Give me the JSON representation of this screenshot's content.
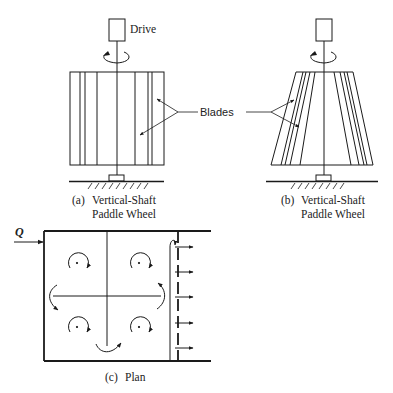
{
  "figure": {
    "labels": {
      "drive": "Drive",
      "blades": "Blades",
      "inflow": "Q"
    },
    "panels": [
      {
        "id": "a",
        "tag": "(a)",
        "title_line1": "Vertical-Shaft",
        "title_line2": "Paddle Wheel",
        "shape": "rectangular-drum"
      },
      {
        "id": "b",
        "tag": "(b)",
        "title_line1": "Vertical-Shaft",
        "title_line2": "Paddle Wheel",
        "shape": "tapered-drum"
      },
      {
        "id": "c",
        "tag": "(c)",
        "title_line1": "Plan",
        "shape": "four-cell-plan-view"
      }
    ],
    "colors": {
      "ink": "#1a1a1a",
      "background": "#ffffff"
    },
    "icons": {
      "rotation": "rotation-arrow-icon",
      "flow": "flow-arrow-icon",
      "ground": "ground-hatch-icon"
    }
  }
}
